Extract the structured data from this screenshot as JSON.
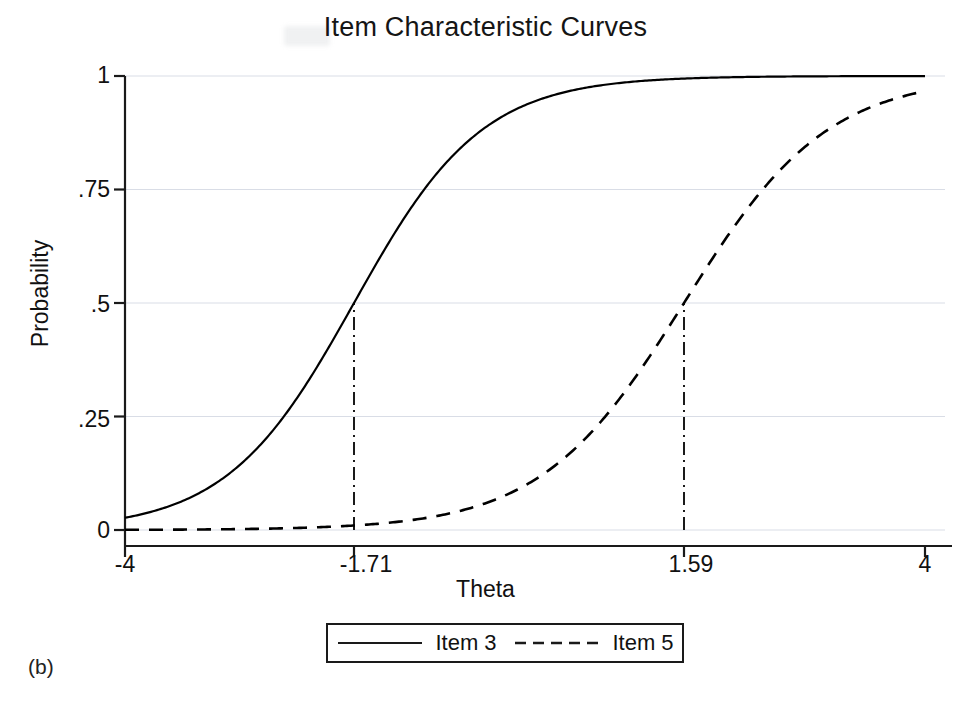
{
  "figure": {
    "panel_label": "(b)",
    "title": "Item Characteristic Curves"
  },
  "chart_data": {
    "type": "line",
    "title": "Item Characteristic Curves",
    "xlabel": "Theta",
    "ylabel": "Probability",
    "xlim": [
      -4,
      4
    ],
    "ylim": [
      0,
      1
    ],
    "grid": true,
    "grid_style": "faint horizontal gridlines at y ticks",
    "legend_position": "below axes, centered, boxed",
    "xticks": [
      -4,
      -1.71,
      1.59,
      4
    ],
    "xticklabels": [
      "-4",
      "-1.71",
      "1.59",
      "4"
    ],
    "yticks": [
      0,
      0.25,
      0.5,
      0.75,
      1
    ],
    "yticklabels": [
      "0",
      ".25",
      ".5",
      ".75",
      "1"
    ],
    "model": "2-parameter logistic (2PL) item response theory",
    "annotations": [
      {
        "name": "difficulty-marker-item-3",
        "kind": "vertical dash-dot drop line",
        "x": -1.71,
        "y_from": 0,
        "y_to": 0.5,
        "label": "-1.71"
      },
      {
        "name": "difficulty-marker-item-5",
        "kind": "vertical dash-dot drop line",
        "x": 1.59,
        "y_from": 0,
        "y_to": 0.5,
        "label": "1.59"
      }
    ],
    "x": [
      -4,
      -3.5,
      -3,
      -2.5,
      -2,
      -1.71,
      -1.5,
      -1,
      -0.5,
      0,
      0.5,
      1,
      1.59,
      2,
      2.5,
      3,
      3.5,
      4
    ],
    "series": [
      {
        "name": "Item 3",
        "linestyle": "solid",
        "color": "#000000",
        "difficulty_b": -1.71,
        "discrimination_a": 0.92,
        "values": [
          0.105,
          0.155,
          0.222,
          0.307,
          0.408,
          0.5,
          0.518,
          0.625,
          0.722,
          0.802,
          0.863,
          0.907,
          0.944,
          0.961,
          0.975,
          0.984,
          0.99,
          0.995
        ]
      },
      {
        "name": "Item 5",
        "linestyle": "dashed",
        "color": "#000000",
        "difficulty_b": 1.59,
        "discrimination_a": 0.82,
        "values": [
          0.012,
          0.018,
          0.026,
          0.039,
          0.057,
          0.074,
          0.083,
          0.119,
          0.168,
          0.232,
          0.31,
          0.401,
          0.5,
          0.57,
          0.66,
          0.74,
          0.808,
          0.862
        ]
      }
    ]
  },
  "axes": {
    "y_ticks": [
      {
        "label": "1",
        "value": 1
      },
      {
        "label": ".75",
        "value": 0.75
      },
      {
        "label": ".5",
        "value": 0.5
      },
      {
        "label": ".25",
        "value": 0.25
      },
      {
        "label": "0",
        "value": 0
      }
    ],
    "x_ticks": [
      {
        "label": "-4",
        "value": -4
      },
      {
        "label": "-1.71",
        "value": -1.71
      },
      {
        "label": "1.59",
        "value": 1.59
      },
      {
        "label": "4",
        "value": 4
      }
    ],
    "x_title": "Theta",
    "y_title": "Probability"
  },
  "legend": {
    "entries": [
      {
        "label": "Item 3",
        "style": "solid"
      },
      {
        "label": "Item 5",
        "style": "dashed"
      }
    ]
  }
}
